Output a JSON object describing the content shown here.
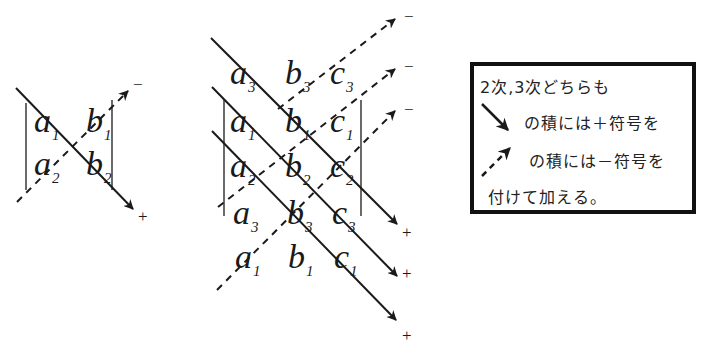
{
  "diagram": {
    "colors": {
      "ink": "#1a1a1a",
      "background": "#ffffff"
    },
    "det2": {
      "cells": [
        {
          "var": "a",
          "sub": "1"
        },
        {
          "var": "b",
          "sub": "1"
        },
        {
          "var": "a",
          "sub": "2"
        },
        {
          "var": "b",
          "sub": "2"
        }
      ],
      "plus_sign": "+",
      "minus_sign": "−"
    },
    "det3": {
      "rows": [
        [
          {
            "var": "a",
            "sub": "3"
          },
          {
            "var": "b",
            "sub": "3"
          },
          {
            "var": "c",
            "sub": "3"
          }
        ],
        [
          {
            "var": "a",
            "sub": "1"
          },
          {
            "var": "b",
            "sub": "1"
          },
          {
            "var": "c",
            "sub": "1"
          }
        ],
        [
          {
            "var": "a",
            "sub": "2"
          },
          {
            "var": "b",
            "sub": "2"
          },
          {
            "var": "c",
            "sub": "2"
          }
        ],
        [
          {
            "var": "a",
            "sub": "3"
          },
          {
            "var": "b",
            "sub": "3"
          },
          {
            "var": "c",
            "sub": "3"
          }
        ],
        [
          {
            "var": "a",
            "sub": "1"
          },
          {
            "var": "b",
            "sub": "1"
          },
          {
            "var": "c",
            "sub": "1"
          }
        ]
      ],
      "plus_signs": [
        "+",
        "+",
        "+"
      ],
      "minus_signs": [
        "−",
        "−",
        "−"
      ]
    },
    "note": {
      "line1": "2次,3次どちらも",
      "line2": "の積には＋符号を",
      "line3": "の積には－符号を",
      "line4": "付けて加える。",
      "solid_arrow_icon": "solid-diagonal-arrow",
      "dashed_arrow_icon": "dashed-diagonal-arrow"
    }
  }
}
